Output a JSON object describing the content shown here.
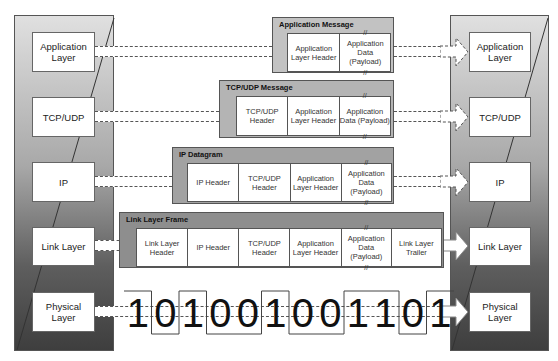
{
  "left_stack": {
    "layers": [
      {
        "label": "Application Layer"
      },
      {
        "label": "TCP/UDP"
      },
      {
        "label": "IP"
      },
      {
        "label": "Link Layer"
      },
      {
        "label": "Physical Layer"
      }
    ]
  },
  "right_stack": {
    "layers": [
      {
        "label": "Application Layer"
      },
      {
        "label": "TCP/UDP"
      },
      {
        "label": "IP"
      },
      {
        "label": "Link Layer"
      },
      {
        "label": "Physical Layer"
      }
    ]
  },
  "messages": {
    "application": {
      "title": "Application Message",
      "cells": [
        "Application Layer Header",
        "Application Data (Payload)"
      ]
    },
    "tcpudp": {
      "title": "TCP/UDP Message",
      "cells": [
        "TCP/UDP Header",
        "Application Layer Header",
        "Application Data (Payload)"
      ]
    },
    "ip": {
      "title": "IP Datagram",
      "cells": [
        "IP Header",
        "TCP/UDP Header",
        "Application Layer Header",
        "Application Data (Payload)"
      ]
    },
    "link": {
      "title": "Link Layer Frame",
      "cells": [
        "Link Layer Header",
        "IP Header",
        "TCP/UDP Header",
        "Application Layer Header",
        "Application Data (Payload)",
        "Link Layer Trailer"
      ]
    }
  },
  "break_mark": "//",
  "physical": {
    "bits": [
      "1",
      "0",
      "1",
      "0",
      "0",
      "1",
      "0",
      "0",
      "1",
      "1",
      "0",
      "1"
    ]
  },
  "colors": {
    "panel_light": "#e0e0e0",
    "panel_dark": "#3e3e3e",
    "message_bg": "#a9a9a9",
    "box_bg": "#ffffff",
    "line": "#555555"
  }
}
